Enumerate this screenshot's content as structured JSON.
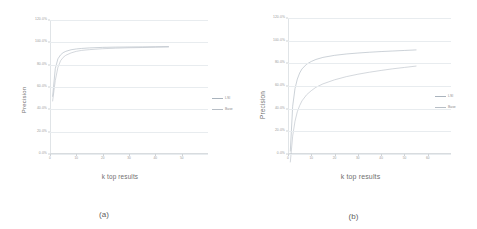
{
  "figure": {
    "panels": [
      {
        "caption": "(a)",
        "legend_position": "right",
        "chart": {
          "type": "line",
          "title": "",
          "xlabel": "k top results",
          "ylabel": "Precision",
          "xlim": [
            0,
            60
          ],
          "ylim": [
            0,
            120
          ],
          "grid": true,
          "yticks": [
            "0.0%",
            "20.0%",
            "40.0%",
            "60.0%",
            "80.0%",
            "100.0%",
            "120.0%"
          ],
          "ytick_values": [
            0,
            20,
            40,
            60,
            80,
            100,
            120
          ],
          "xticks": [
            "0",
            "10",
            "20",
            "30",
            "40",
            "50"
          ],
          "xtick_values": [
            0,
            10,
            20,
            30,
            40,
            50
          ],
          "x": [
            1,
            2,
            3,
            4,
            5,
            6,
            8,
            10,
            12,
            15,
            20,
            25,
            30,
            35,
            40,
            45
          ],
          "series": [
            {
              "name": "LSI",
              "color": "#a9b3bd",
              "values": [
                62,
                83,
                90.5,
                93.5,
                95.2,
                96.2,
                97.4,
                98.0,
                98.4,
                98.8,
                99.2,
                99.4,
                99.5,
                99.6,
                99.7,
                99.8
              ]
            },
            {
              "name": "Base",
              "color": "#b7bec6",
              "values": [
                58.5,
                74,
                84,
                89,
                91.6,
                93.2,
                95.0,
                96.2,
                96.9,
                97.5,
                98.2,
                98.6,
                98.9,
                99.1,
                99.3,
                99.5
              ]
            }
          ]
        }
      },
      {
        "caption": "(b)",
        "legend_position": "right",
        "chart": {
          "type": "line",
          "title": "",
          "xlabel": "k top results",
          "ylabel": "Precision",
          "xlim": [
            0,
            70
          ],
          "ylim": [
            0,
            120
          ],
          "grid": true,
          "yticks": [
            "0.0%",
            "20.0%",
            "40.0%",
            "60.0%",
            "80.0%",
            "100.0%",
            "120.0%"
          ],
          "ytick_values": [
            0,
            20,
            40,
            60,
            80,
            100,
            120
          ],
          "xticks": [
            "0",
            "10",
            "20",
            "30",
            "40",
            "50",
            "60"
          ],
          "xtick_values": [
            0,
            10,
            20,
            30,
            40,
            50,
            60
          ],
          "x": [
            1,
            2,
            3,
            4,
            5,
            6,
            8,
            10,
            12,
            15,
            20,
            25,
            30,
            35,
            40,
            45,
            50,
            55
          ],
          "series": [
            {
              "name": "LSI",
              "color": "#a9b3bd",
              "values": [
                22,
                55,
                68,
                75,
                79.5,
                82.5,
                86,
                88,
                89.5,
                91,
                92.5,
                93.5,
                94.2,
                94.8,
                95.3,
                95.7,
                96.1,
                96.5
              ]
            },
            {
              "name": "Base",
              "color": "#b7bec6",
              "values": [
                14,
                33,
                44,
                51,
                55.5,
                59,
                63.5,
                66.5,
                69,
                71.5,
                74.5,
                76.8,
                78.6,
                80.1,
                81.4,
                82.6,
                83.6,
                84.6
              ]
            }
          ]
        }
      }
    ]
  },
  "colors": {
    "gridline": "#e8ecef",
    "tick_text": "#9a9a9a",
    "axis_title": "#6f6f6f"
  }
}
